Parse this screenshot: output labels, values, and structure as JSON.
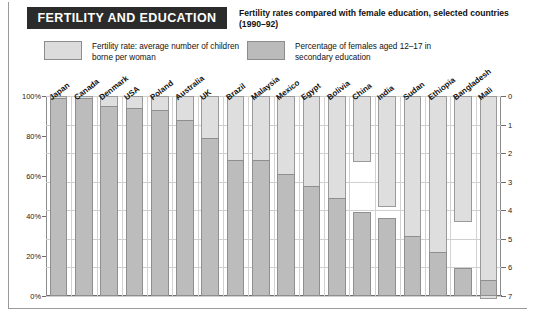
{
  "header": {
    "title": "FERTILITY AND EDUCATION",
    "subtitle": "Fertility rates compared with female education, selected countries (1990–92)"
  },
  "legend": {
    "items": [
      {
        "label": "Fertility rate: average number of children borne per woman",
        "color": "#dedede"
      },
      {
        "label": "Percentage of females aged 12–17 in secondary education",
        "color": "#bcbcbc"
      }
    ]
  },
  "axes": {
    "left_ticks": [
      "0%",
      "20%",
      "40%",
      "60%",
      "80%",
      "100%"
    ],
    "right_ticks": [
      "0",
      "1",
      "2",
      "3",
      "4",
      "5",
      "6",
      "7"
    ]
  },
  "chart_data": {
    "type": "bar",
    "title": "FERTILITY AND EDUCATION",
    "subtitle": "Fertility rates compared with female education, selected countries (1990–92)",
    "xlabel": "",
    "categories": [
      "Japan",
      "Canada",
      "Denmark",
      "USA",
      "Poland",
      "Australia",
      "UK",
      "Brazil",
      "Malaysia",
      "Mexico",
      "Egypt",
      "Bolivia",
      "China",
      "India",
      "Sudan",
      "Ethiopia",
      "Bangladesh",
      "Mali"
    ],
    "grid": true,
    "legend_position": "top",
    "series": [
      {
        "name": "Fertility rate: average number of children borne per woman",
        "unit": "children per woman",
        "axis": "right",
        "axis_label": "Fertility rate",
        "axis_inverted": true,
        "ylim": [
          0,
          7
        ],
        "color": "#dedede",
        "values": [
          1.5,
          1.8,
          1.7,
          2.1,
          2.0,
          1.9,
          1.8,
          2.9,
          3.6,
          3.2,
          3.9,
          4.8,
          2.3,
          3.9,
          6.0,
          7.0,
          4.4,
          7.1
        ]
      },
      {
        "name": "Percentage of females aged 12–17 in secondary education",
        "unit": "%",
        "axis": "left",
        "axis_label": "Percentage in secondary education",
        "ylim": [
          0,
          100
        ],
        "color": "#bcbcbc",
        "values": [
          99,
          99,
          95,
          94,
          93,
          88,
          79,
          68,
          68,
          61,
          55,
          49,
          42,
          39,
          30,
          22,
          14,
          8
        ]
      }
    ]
  }
}
